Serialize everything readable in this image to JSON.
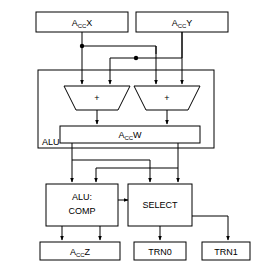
{
  "diagram": {
    "type": "block-diagram",
    "colors": {
      "background": "#ffffff",
      "stroke": "#000000",
      "fill": "#ffffff"
    },
    "registers": {
      "x": {
        "prefix": "A",
        "subscript": "CC",
        "suffix": "X"
      },
      "y": {
        "prefix": "A",
        "subscript": "CC",
        "suffix": "Y"
      },
      "w": {
        "prefix": "A",
        "subscript": "CC",
        "suffix": "W"
      },
      "z": {
        "prefix": "A",
        "subscript": "CC",
        "suffix": "Z"
      }
    },
    "group": {
      "alu_label": "ALU"
    },
    "adders": {
      "left_op": "+",
      "right_op": "+"
    },
    "units": {
      "comp_line1": "ALU:",
      "comp_line2": "COMP",
      "select": "SELECT"
    },
    "outputs": {
      "trn0": "TRN0",
      "trn1": "TRN1"
    }
  }
}
